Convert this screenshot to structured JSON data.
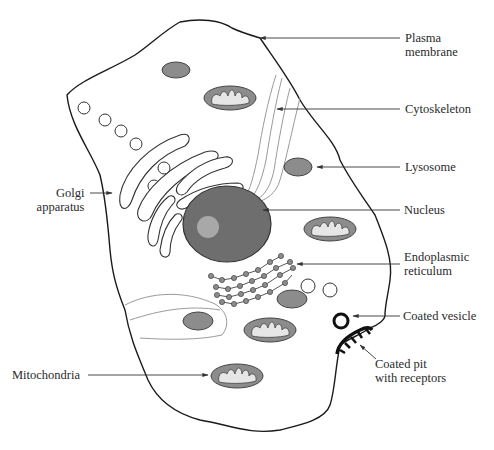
{
  "labels": {
    "plasma_membrane": [
      "Plasma",
      "membrane"
    ],
    "cytoskeleton": "Cytoskeleton",
    "lysosome": "Lysosome",
    "golgi": [
      "Golgi",
      "apparatus"
    ],
    "nucleus": "Nucleus",
    "er": [
      "Endoplasmic",
      "reticulum"
    ],
    "coated_vesicle": "Coated vesicle",
    "coated_pit": [
      "Coated pit",
      "with receptors"
    ],
    "mitochondria": "Mitochondria"
  },
  "colors": {
    "membrane": "#1a1a1a",
    "organelle_fill": "#8c8c8c",
    "nucleus_fill": "#6e6e6e",
    "nucleolus_fill": "#a8a8a8",
    "cristae_fill": "#e6e6e6",
    "cytoskeleton": "#9a9a9a",
    "label_text": "#2a2a2a"
  }
}
